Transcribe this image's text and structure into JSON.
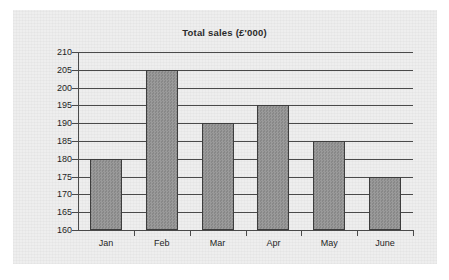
{
  "chart_data": {
    "type": "bar",
    "title": "Total sales (£'000)",
    "categories": [
      "Jan",
      "Feb",
      "Mar",
      "Apr",
      "May",
      "June"
    ],
    "values": [
      180,
      205,
      190,
      195,
      185,
      175
    ],
    "xlabel": "",
    "ylabel": "",
    "ylim": [
      160,
      210
    ],
    "ytick_step": 5,
    "yticks": [
      210,
      205,
      200,
      195,
      190,
      185,
      180,
      175,
      170,
      165,
      160
    ],
    "ytick_labels": [
      "210",
      "205",
      "200",
      "195",
      "190",
      "185",
      "180",
      "175",
      "170",
      "165",
      "160"
    ],
    "grid": true,
    "legend": false,
    "series": [
      {
        "name": "Total sales",
        "values": [
          180,
          205,
          190,
          195,
          185,
          175
        ]
      }
    ],
    "colors": {
      "bar_fill": "#929292",
      "bar_border": "#3d3d3d",
      "axis": "#4a4a4a",
      "grid": "#4a4a4a",
      "text": "#1f1f1f",
      "title": "#2b2b2b",
      "panel_background": "#eeeeee",
      "page_background": "#ffffff"
    }
  }
}
